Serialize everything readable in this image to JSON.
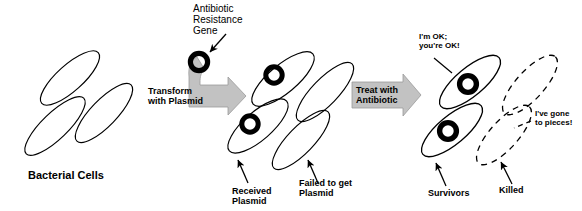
{
  "figure": {
    "title_alt": "Bacterial transformation and antibiotic selection diagram",
    "background_color": "#ffffff",
    "line_color": "#000000",
    "arrow_fill": "#c2c2c2",
    "arrow_stroke": "#9a9a9a",
    "plasmid_color": "#000000"
  },
  "labels": {
    "bacterial_cells": "Bacterial Cells",
    "antibiotic_resistance_gene": "Antibiotic\nResistance\nGene",
    "received_plasmid": "Received\nPlasmid",
    "failed_to_get_plasmid": "Failed to get\nPlasmid",
    "survivors": "Survivors",
    "killed": "Killed",
    "im_ok_youre_ok": "I'm OK;\nyou're OK!",
    "ive_gone_to_pieces": "I've gone\nto pieces!"
  },
  "arrows": {
    "transform": "Transform\nwith Plasmid",
    "treat": "Treat with\nAntibiotic"
  },
  "stages": {
    "left": {
      "name": "untransformed-bacteria",
      "cell_count": 3,
      "cells_with_plasmid": 0
    },
    "middle": {
      "name": "transformed-mixture",
      "cell_count": 4,
      "cells_with_plasmid": 2
    },
    "right": {
      "name": "after-antibiotic-selection",
      "cell_count": 4,
      "cells_with_plasmid": 2,
      "cells_alive": 2,
      "cells_killed": 2
    }
  }
}
